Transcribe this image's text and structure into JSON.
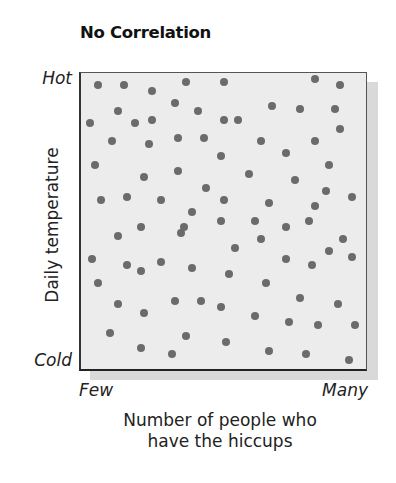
{
  "chart_data": {
    "type": "scatter",
    "title": "No Correlation",
    "xlabel": "Number of people who have the hiccups",
    "ylabel": "Daily temperature",
    "x_tick_labels": {
      "min": "Few",
      "max": "Many"
    },
    "y_tick_labels": {
      "min": "Cold",
      "max": "Hot"
    },
    "xlim": [
      0,
      100
    ],
    "ylim": [
      0,
      100
    ],
    "grid": false,
    "legend": null,
    "colors": {
      "points": "#6b6b6b",
      "plot_background": "#ececec",
      "shadow": "#d9d9d9",
      "frame": "#333333"
    },
    "points": [
      {
        "x": 6,
        "y": 96
      },
      {
        "x": 15,
        "y": 96
      },
      {
        "x": 25,
        "y": 94
      },
      {
        "x": 37,
        "y": 97
      },
      {
        "x": 50,
        "y": 97
      },
      {
        "x": 82,
        "y": 98
      },
      {
        "x": 91,
        "y": 96
      },
      {
        "x": 33,
        "y": 90
      },
      {
        "x": 41,
        "y": 87
      },
      {
        "x": 13,
        "y": 87
      },
      {
        "x": 67,
        "y": 89
      },
      {
        "x": 77,
        "y": 88
      },
      {
        "x": 89,
        "y": 88
      },
      {
        "x": 3,
        "y": 83
      },
      {
        "x": 19,
        "y": 83
      },
      {
        "x": 25,
        "y": 84
      },
      {
        "x": 50,
        "y": 84
      },
      {
        "x": 55,
        "y": 84
      },
      {
        "x": 91,
        "y": 81
      },
      {
        "x": 11,
        "y": 77
      },
      {
        "x": 24,
        "y": 76
      },
      {
        "x": 34,
        "y": 78
      },
      {
        "x": 43,
        "y": 78
      },
      {
        "x": 63,
        "y": 77
      },
      {
        "x": 82,
        "y": 77
      },
      {
        "x": 5,
        "y": 69
      },
      {
        "x": 49,
        "y": 72
      },
      {
        "x": 72,
        "y": 73
      },
      {
        "x": 87,
        "y": 69
      },
      {
        "x": 22,
        "y": 65
      },
      {
        "x": 34,
        "y": 67
      },
      {
        "x": 59,
        "y": 66
      },
      {
        "x": 75,
        "y": 64
      },
      {
        "x": 44,
        "y": 61
      },
      {
        "x": 86,
        "y": 60
      },
      {
        "x": 95,
        "y": 58
      },
      {
        "x": 7,
        "y": 57
      },
      {
        "x": 16,
        "y": 58
      },
      {
        "x": 28,
        "y": 57
      },
      {
        "x": 50,
        "y": 57
      },
      {
        "x": 66,
        "y": 56
      },
      {
        "x": 82,
        "y": 55
      },
      {
        "x": 39,
        "y": 53
      },
      {
        "x": 49,
        "y": 50
      },
      {
        "x": 61,
        "y": 50
      },
      {
        "x": 80,
        "y": 50
      },
      {
        "x": 21,
        "y": 48
      },
      {
        "x": 36,
        "y": 48
      },
      {
        "x": 72,
        "y": 48
      },
      {
        "x": 13,
        "y": 45
      },
      {
        "x": 35,
        "y": 46
      },
      {
        "x": 63,
        "y": 44
      },
      {
        "x": 92,
        "y": 44
      },
      {
        "x": 54,
        "y": 41
      },
      {
        "x": 87,
        "y": 40
      },
      {
        "x": 95,
        "y": 38
      },
      {
        "x": 4,
        "y": 37
      },
      {
        "x": 16,
        "y": 35
      },
      {
        "x": 28,
        "y": 36
      },
      {
        "x": 21,
        "y": 33
      },
      {
        "x": 39,
        "y": 34
      },
      {
        "x": 72,
        "y": 37
      },
      {
        "x": 81,
        "y": 35
      },
      {
        "x": 6,
        "y": 29
      },
      {
        "x": 52,
        "y": 32
      },
      {
        "x": 65,
        "y": 29
      },
      {
        "x": 13,
        "y": 22
      },
      {
        "x": 33,
        "y": 23
      },
      {
        "x": 42,
        "y": 23
      },
      {
        "x": 49,
        "y": 21
      },
      {
        "x": 77,
        "y": 24
      },
      {
        "x": 90,
        "y": 22
      },
      {
        "x": 22,
        "y": 19
      },
      {
        "x": 61,
        "y": 18
      },
      {
        "x": 73,
        "y": 16
      },
      {
        "x": 83,
        "y": 15
      },
      {
        "x": 96,
        "y": 15
      },
      {
        "x": 10,
        "y": 12
      },
      {
        "x": 37,
        "y": 11
      },
      {
        "x": 51,
        "y": 9
      },
      {
        "x": 21,
        "y": 7
      },
      {
        "x": 32,
        "y": 5
      },
      {
        "x": 66,
        "y": 6
      },
      {
        "x": 79,
        "y": 5
      },
      {
        "x": 94,
        "y": 3
      }
    ]
  }
}
